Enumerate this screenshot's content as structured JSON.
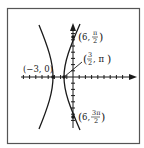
{
  "figure": {
    "type": "polar-hyperbola",
    "frame": {
      "x": 7,
      "y": 8,
      "width": 133,
      "height": 136,
      "stroke": "#555555"
    },
    "axes": {
      "origin": {
        "x": 73,
        "y": 77
      },
      "x_axis": {
        "from": 21,
        "to": 137,
        "tick_spacing": 6.2,
        "arrow": true
      },
      "y_axis": {
        "from": 24,
        "to": 130,
        "tick_spacing": 6.2,
        "arrow": true
      }
    },
    "curve_color": "#1a1a1a",
    "points": [
      {
        "name": "vertex-left",
        "label": "(−3, 0)",
        "x": 53,
        "y": 77
      },
      {
        "name": "vertex-right",
        "label": "(3/2, π)",
        "x": 64,
        "y": 77
      },
      {
        "name": "point-top",
        "label": "(6, π/2)",
        "x": 73,
        "y": 37
      },
      {
        "name": "point-bottom",
        "label": "(6, 3π/2)",
        "x": 73,
        "y": 117
      }
    ],
    "labels": {
      "left_vertex": {
        "open": "(",
        "a": "−3",
        "sep": ", ",
        "b": "0",
        "close": ")"
      },
      "top_point": {
        "r": "6",
        "num": "π",
        "den": "2"
      },
      "right_vertex": {
        "num": "3",
        "den": "2",
        "theta": "π"
      },
      "bottom_point": {
        "r": "6",
        "num": "3π",
        "den": "2"
      }
    }
  }
}
